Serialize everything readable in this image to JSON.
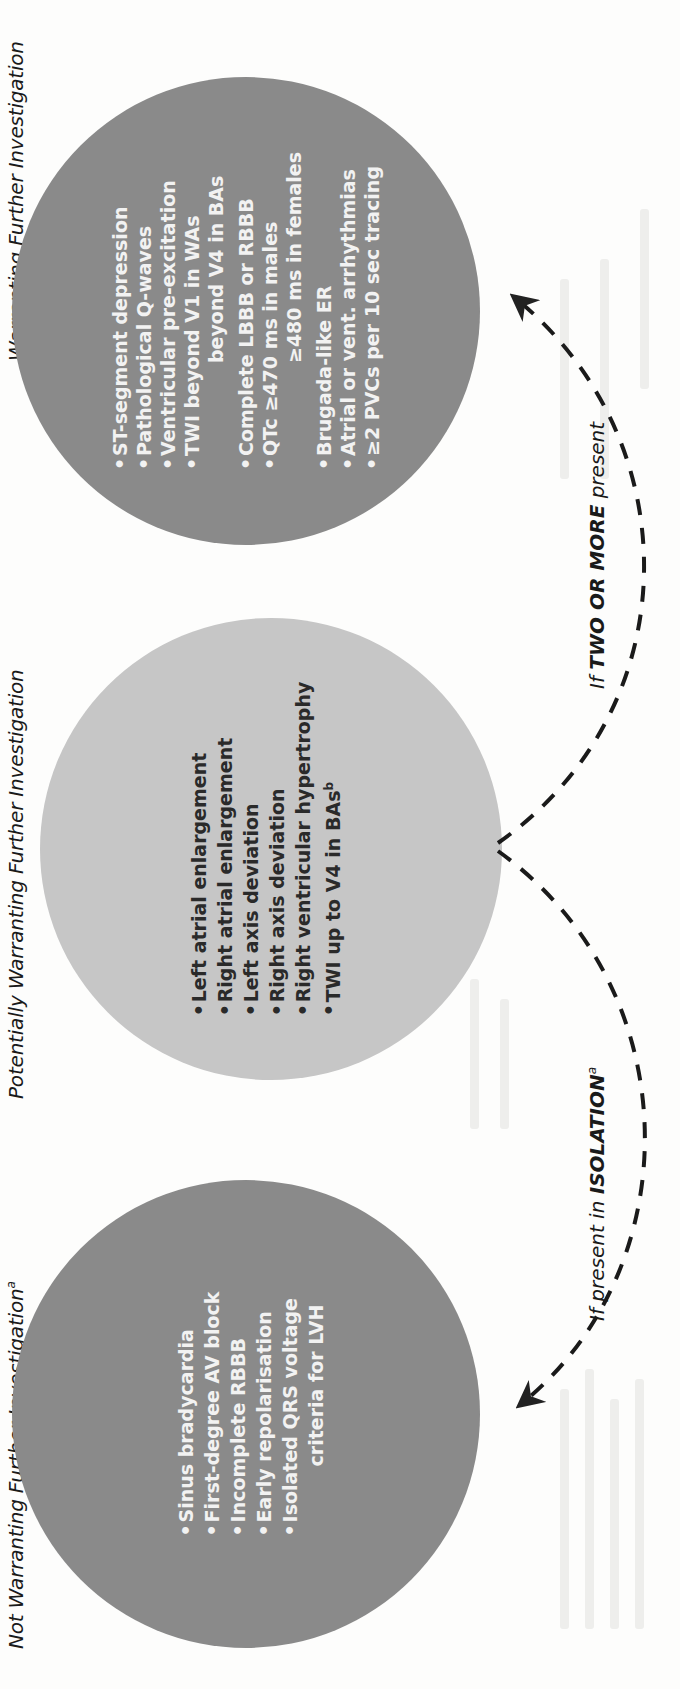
{
  "figure": {
    "categories": [
      {
        "id": "not-warranting",
        "heading": "Not Warranting Further Investigation",
        "heading_sup": "a",
        "shade": "#8a8a8a",
        "items": [
          {
            "text": "Sinus bradycardia"
          },
          {
            "text": "First-degree AV block"
          },
          {
            "text": "Incomplete RBBB"
          },
          {
            "text": "Early repolarisation"
          },
          {
            "text": "Isolated QRS voltage",
            "cont": "criteria for LVH"
          }
        ]
      },
      {
        "id": "potentially-warranting",
        "heading": "Potentially Warranting Further Investigation",
        "shade": "#c6c6c6",
        "items": [
          {
            "text": "Left atrial enlargement"
          },
          {
            "text": "Right atrial enlargement"
          },
          {
            "text": "Left axis deviation"
          },
          {
            "text": "Right axis deviation"
          },
          {
            "text": "Right ventricular hypertrophy"
          },
          {
            "text": "TWI up to V4 in BAs",
            "sup": "b"
          }
        ]
      },
      {
        "id": "warranting",
        "heading": "Warranting Further Investigation",
        "shade": "#8a8a8a",
        "items": [
          {
            "text": "ST-segment depression"
          },
          {
            "text": "Pathological Q-waves"
          },
          {
            "text": "Ventricular pre-excitation"
          },
          {
            "text": "TWI beyond V1 in WAs",
            "cont": "beyond V4 in BAs",
            "cont_style": "wide"
          },
          {
            "text": "Complete LBBB or RBBB"
          },
          {
            "text": "QTc ≥470 ms in males",
            "cont": "≥480 ms in females",
            "cont_style": "wide"
          },
          {
            "text": "Brugada-like ER"
          },
          {
            "text": "Atrial or vent. arrhythmias"
          },
          {
            "text": "≥2 PVCs per 10 sec tracing"
          }
        ]
      }
    ],
    "arrows": {
      "isolation": {
        "prefix": "If present in ",
        "emphasis": "ISOLATION",
        "sup": "a"
      },
      "two_or_more": {
        "prefix": "If ",
        "emphasis": "TWO OR MORE",
        "suffix": " present"
      }
    },
    "bullet_glyph": "•"
  }
}
